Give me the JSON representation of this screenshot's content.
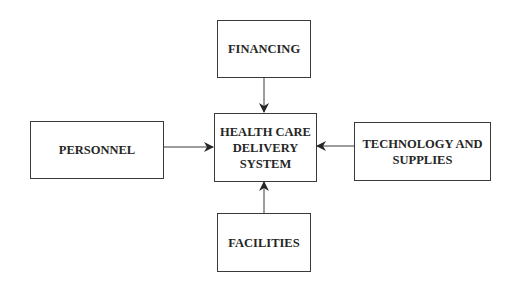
{
  "diagram": {
    "center": {
      "label": "HEALTH CARE\nDELIVERY\nSYSTEM"
    },
    "inputs": [
      {
        "id": "financing",
        "label": "FINANCING",
        "direction": "top"
      },
      {
        "id": "personnel",
        "label": "PERSONNEL",
        "direction": "left"
      },
      {
        "id": "technology",
        "label": "TECHNOLOGY AND\nSUPPLIES",
        "direction": "right"
      },
      {
        "id": "facilities",
        "label": "FACILITIES",
        "direction": "bottom"
      }
    ],
    "colors": {
      "line": "#3a3a3a",
      "text": "#262626",
      "background": "#ffffff"
    }
  }
}
